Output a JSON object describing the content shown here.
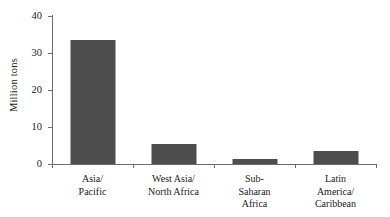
{
  "chart_data": {
    "type": "bar",
    "title": "",
    "subtitle": "",
    "xlabel": "",
    "ylabel": "Million tons",
    "categories": [
      "Asia/\nPacific",
      "West Asia/\nNorth Africa",
      "Sub-\nSaharan\nAfrica",
      "Latin\nAmerica/\nCaribbean"
    ],
    "values": [
      33.2,
      5.3,
      1.4,
      3.5
    ],
    "ylim": [
      0,
      40
    ],
    "yticks": [
      0,
      10,
      20,
      30,
      40
    ],
    "ytick_labels": [
      "0",
      "10",
      "20",
      "30",
      "40"
    ],
    "grid": false,
    "legend": false,
    "legend_position": "none",
    "bar_color": "#4d4d4d",
    "axis_color": "#6e6e6e",
    "background_color": "#ffffff"
  }
}
